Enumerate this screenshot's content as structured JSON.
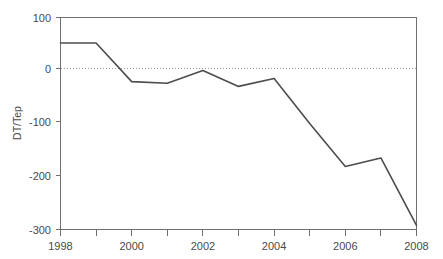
{
  "chart_data": {
    "type": "line",
    "title": "",
    "xlabel": "",
    "ylabel": "DT/Tep",
    "x": [
      1998,
      1999,
      2000,
      2001,
      2002,
      2003,
      2004,
      2005,
      2006,
      2007,
      2008
    ],
    "values": [
      52,
      52,
      -21,
      -24,
      0,
      -30,
      -15,
      -100,
      -181,
      -165,
      -292
    ],
    "series": [
      {
        "name": "DT/Tep",
        "values": [
          52,
          52,
          -21,
          -24,
          0,
          -30,
          -15,
          -100,
          -181,
          -165,
          -292
        ]
      }
    ],
    "xlim": [
      1998,
      2008
    ],
    "ylim": [
      -300,
      100
    ],
    "x_tick_labels": [
      "1998",
      "2000",
      "2002",
      "2004",
      "2006",
      "2008"
    ],
    "x_tick_values": [
      1998,
      2000,
      2002,
      2004,
      2006,
      2008
    ],
    "x_minor_tick_values": [
      1999,
      2001,
      2003,
      2005,
      2007
    ],
    "y_tick_labels": [
      "100",
      "0",
      "-100",
      "-200",
      "-300"
    ],
    "y_tick_values": [
      100,
      0,
      -100,
      -200,
      -300
    ],
    "grid": false,
    "zero_reference_line": true,
    "legend": false,
    "legend_position": "none",
    "line_color": "#4d4d4d",
    "axis_color": "#6f6f6f",
    "zero_line_color": "#9a9a9a",
    "background_color": "#ffffff"
  },
  "axis": {
    "y_title": "DT/Tep"
  },
  "ticks": {
    "y": {
      "t0": "100",
      "t1": "0",
      "t2": "-100",
      "t3": "-200",
      "t4": "-300"
    },
    "x": {
      "t0": "1998",
      "t1": "2000",
      "t2": "2002",
      "t3": "2004",
      "t4": "2006",
      "t5": "2008"
    }
  }
}
